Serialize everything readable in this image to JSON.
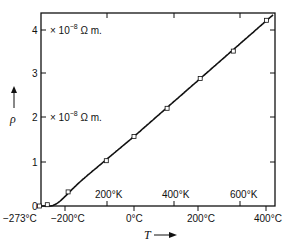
{
  "chart_data": {
    "type": "line",
    "title": "",
    "xlabel": "T",
    "ylabel": "ρ",
    "ylim": [
      0,
      4.4
    ],
    "xlim": [
      -273,
      420
    ],
    "grid": false,
    "y_ticks": [
      "0",
      "1",
      "2",
      "3",
      "4"
    ],
    "x_ticks_celsius": [
      "−273°C",
      "−200°C",
      "0°C",
      "200°C",
      "400°C"
    ],
    "x_ticks_kelvin": [
      "200°K",
      "400°K",
      "600°K"
    ],
    "annotations": [
      "× 10⁻⁸ Ω m.",
      "× 10⁻⁸ Ω m."
    ],
    "series": [
      {
        "name": "resistivity",
        "x": [
          -273,
          -250,
          -190,
          -80,
          0,
          100,
          200,
          300,
          400
        ],
        "values": [
          0.0,
          0.03,
          0.32,
          1.03,
          1.58,
          2.22,
          2.9,
          3.52,
          4.22
        ]
      }
    ]
  },
  "labels": {
    "y0": "0",
    "y1": "1",
    "y2": "2",
    "y3": "3",
    "y4": "4",
    "unit_top": "× 10",
    "unit_exp": "−8",
    "unit_suffix": " Ω m.",
    "c_m273": "−273°C",
    "c_m200": "−200°C",
    "c_0": "0°C",
    "c_200": "200°C",
    "c_400": "400°C",
    "k_200": "200°K",
    "k_400": "400°K",
    "k_600": "600°K",
    "xlabel": "T",
    "ylabel": "ρ"
  }
}
